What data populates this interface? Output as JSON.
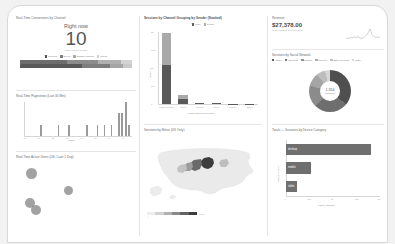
{
  "page": {
    "background": "#f2f2f2",
    "surface": "#ffffff",
    "accent": "#555555"
  },
  "panels": {
    "realtime_now": {
      "title": "Real-Time Conversions by Channel",
      "heading": "Right now",
      "value": "10",
      "subtitle": "active users on site",
      "legend": [
        {
          "label": "Referral",
          "color": "#4a4a4a"
        },
        {
          "label": "Direct",
          "color": "#7c7c7c"
        },
        {
          "label": "Organic Search",
          "color": "#a8a8a8"
        },
        {
          "label": "Social",
          "color": "#cfcfcf"
        }
      ],
      "bar_top": [
        {
          "label": "Referral",
          "value": 42,
          "color": "#6d6d6d"
        },
        {
          "label": "Direct",
          "value": 28,
          "color": "#8c8c8c"
        },
        {
          "label": "Organic Search",
          "value": 20,
          "color": "#b0b0b0"
        },
        {
          "label": "Social",
          "value": 10,
          "color": "#d2d2d2"
        }
      ],
      "bar_bottom": [
        {
          "label": "Referral",
          "value": 55,
          "color": "#5a5a5a"
        },
        {
          "label": "Direct",
          "value": 25,
          "color": "#7e7e7e"
        },
        {
          "label": "Organic Search",
          "value": 12,
          "color": "#a6a6a6"
        },
        {
          "label": "Social",
          "value": 8,
          "color": "#c9c9c9"
        }
      ]
    },
    "realtime_pageviews": {
      "title": "Real-Time Pageviews (Last 30 Min)",
      "xlabel": "Minute",
      "ylabel": "Pageviews"
    },
    "realtime_active_users": {
      "title": "Real-Time Active Users (US / Last 1 Day)"
    },
    "sessions_by_channel": {
      "title": "Sessions by Channel Grouping by Gender (Stacked)"
    },
    "sessions_by_metro": {
      "title": "Sessions by Metro (US Only)",
      "scale_min": "0",
      "scale_max": "1,330"
    },
    "revenue": {
      "title": "Revenue",
      "value": "$27,378.00",
      "subtitle": "vs previous 28 days (all users)"
    },
    "sessions_by_social": {
      "title": "Sessions by Social Network"
    },
    "sessions_by_device": {
      "title": "Totals — Sessions by Device Category"
    }
  },
  "chart_data": [
    {
      "id": "realtime-pageviews",
      "type": "bar",
      "title": "Real-Time Pageviews (Last 30 Min)",
      "xlabel": "Minute",
      "ylabel": "Pageviews",
      "categories": [
        "-30",
        "-29",
        "-28",
        "-27",
        "-26",
        "-25",
        "-24",
        "-23",
        "-22",
        "-21",
        "-20",
        "-19",
        "-18",
        "-17",
        "-16",
        "-15",
        "-14",
        "-13",
        "-12",
        "-11",
        "-10",
        "-9",
        "-8",
        "-7",
        "-6",
        "-5",
        "-4",
        "-3",
        "-2",
        "-1"
      ],
      "values": [
        0,
        0,
        0,
        0,
        1,
        0,
        0,
        0,
        0,
        1,
        0,
        0,
        1,
        0,
        0,
        0,
        0,
        1,
        0,
        0,
        1,
        0,
        1,
        0,
        1,
        0,
        2,
        2,
        3,
        1
      ],
      "ylim": [
        0,
        3
      ],
      "grid": false,
      "color": "#9a9a9a"
    },
    {
      "id": "sessions-by-channel",
      "type": "bar",
      "stacked": true,
      "title": "Sessions by Channel Grouping by Gender (Stacked)",
      "xlabel": "Default Channel Grouping",
      "ylabel": "Sessions",
      "categories": [
        "Organic Search",
        "Direct",
        "Referral",
        "Social",
        "Display",
        "Email"
      ],
      "series": [
        {
          "name": "male",
          "values": [
            1180,
            150,
            26,
            22,
            6,
            3
          ],
          "color": "#595959"
        },
        {
          "name": "female",
          "values": [
            980,
            120,
            20,
            16,
            5,
            2
          ],
          "color": "#a9a9a9"
        }
      ],
      "ylim": [
        0,
        2200
      ],
      "yticks": [
        "0",
        "500",
        "1K",
        "1.5K",
        "2K"
      ],
      "legend_position": "top"
    },
    {
      "id": "sessions-by-metro",
      "type": "heatmap",
      "title": "Sessions by Metro (US Only)",
      "region": "United States",
      "metric": "Sessions",
      "scale_min": 0,
      "scale_max": 1330,
      "top_regions": [
        {
          "name": "Chicago IL",
          "value": 1330
        },
        {
          "name": "Des Moines-Ames IA",
          "value": 520
        },
        {
          "name": "Kansas City MO",
          "value": 410
        },
        {
          "name": "Omaha NE",
          "value": 260
        },
        {
          "name": "Minneapolis-St. Paul MN",
          "value": 180
        }
      ],
      "color_low": "#ececec",
      "color_high": "#3d3d3d"
    },
    {
      "id": "revenue-scorecard",
      "type": "line",
      "title": "Revenue",
      "value": "$27,378.00",
      "x": [
        "1",
        "2",
        "3",
        "4",
        "5",
        "6",
        "7",
        "8",
        "9",
        "10",
        "11",
        "12",
        "13",
        "14",
        "15",
        "16",
        "17",
        "18",
        "19",
        "20"
      ],
      "values": [
        4,
        3,
        5,
        4,
        6,
        5,
        7,
        4,
        3,
        5,
        8,
        12,
        28,
        9,
        6,
        5,
        7,
        6,
        5,
        4
      ],
      "color": "#9c9c9c"
    },
    {
      "id": "sessions-by-social",
      "type": "pie",
      "title": "Sessions by Social Network",
      "center_value": "1,354",
      "center_label": "Sessions",
      "labels": [
        "Twitter",
        "Facebook",
        "Blogger",
        "LinkedIn",
        "Stack Overflow",
        "Other"
      ],
      "values": [
        488,
        352,
        230,
        140,
        92,
        52
      ],
      "colors": [
        "#4f4f4f",
        "#6e6e6e",
        "#8b8b8b",
        "#a5a5a5",
        "#bdbdbd",
        "#d6d6d6"
      ],
      "legend_position": "top"
    },
    {
      "id": "sessions-by-device",
      "type": "bar",
      "orientation": "horizontal",
      "title": "Totals — Sessions by Device Category",
      "xlabel": "Pages / Session",
      "ylabel": "Device Category",
      "categories": [
        "desktop",
        "mobile",
        "tablet"
      ],
      "values": [
        2360,
        690,
        300
      ],
      "xlim": [
        0,
        2600
      ],
      "xticks": [
        "0",
        "500",
        "1K",
        "1.5K",
        "2K"
      ],
      "color": "#6f6f6f"
    }
  ]
}
